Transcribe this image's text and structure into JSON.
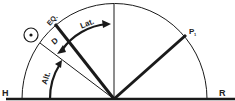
{
  "diagram": {
    "labels": {
      "horizon_left": "H",
      "horizon_right": "R",
      "equator": "EQ.",
      "declination": "D",
      "latitude": "Lat.",
      "altitude": "Alt.",
      "pole": "P"
    },
    "colors": {
      "line": "#1a1a1a",
      "background": "#ffffff"
    }
  }
}
